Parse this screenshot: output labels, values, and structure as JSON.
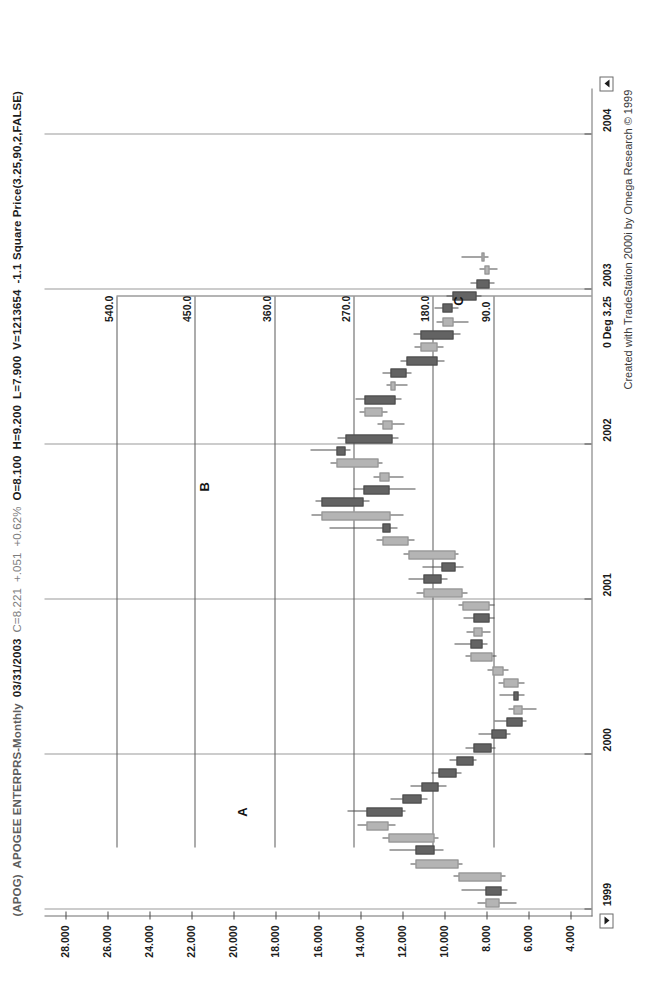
{
  "window": {
    "app": "TradeStation 2000i",
    "footer": "Created with TradeStation 2000i by Omega Research © 1999"
  },
  "header": {
    "symbol": "(APOG)",
    "name": "APOGEE ENTERPRS-Monthly",
    "date": "03/31/2003",
    "close": "C=8.221",
    "change": "+.051",
    "change_pct": "+0.62%",
    "open": "O=8.100",
    "high": "H=9.200",
    "low": "L=7.900",
    "volume": "V=1213654",
    "study": "-1.1 Square Price(3.25,90,2,FALSE)"
  },
  "controls": {
    "scroll_left": "scroll-left-arrow",
    "scroll_right": "scroll-right-arrow"
  },
  "chart_data": {
    "type": "candlestick",
    "xlabel": "",
    "ylabel": "",
    "grid": true,
    "legend": "none",
    "ylim": [
      3.0,
      29.0
    ],
    "yticks": [
      "28.000",
      "26.000",
      "24.000",
      "22.000",
      "20.000",
      "18.000",
      "16.000",
      "14.000",
      "12.000",
      "10.000",
      "8.000",
      "6.000",
      "4.000"
    ],
    "ytick_values": [
      28,
      26,
      24,
      22,
      20,
      18,
      16,
      14,
      12,
      10,
      8,
      6,
      4
    ],
    "xticks": [
      "1999",
      "2000",
      "2001",
      "2002",
      "2003",
      "2004"
    ],
    "xtick_values": [
      1999,
      2000,
      2001,
      2002,
      2003,
      2004
    ],
    "overlay": {
      "name": "Square Price(3.25,90,2,FALSE)",
      "origin_label": "0 Deg 3.25",
      "origin_x": 2002.96,
      "lines": [
        {
          "label": "540.0",
          "value": 25.6,
          "x_start": 1999.4
        },
        {
          "label": "450.0",
          "value": 21.85,
          "x_start": 1999.4
        },
        {
          "label": "360.0",
          "value": 18.05,
          "x_start": 1999.4
        },
        {
          "label": "270.0",
          "value": 14.3,
          "x_start": 1999.4
        },
        {
          "label": "180.0",
          "value": 10.55,
          "x_start": 1999.4
        },
        {
          "label": "90.0",
          "value": 7.65,
          "x_start": 1999.4
        }
      ]
    },
    "annotations": [
      {
        "text": "A",
        "x": 1999.63,
        "y": 19.6
      },
      {
        "text": "B",
        "x": 2001.73,
        "y": 21.4
      },
      {
        "text": "C",
        "x": 2002.93,
        "y": 9.3
      }
    ],
    "bars": [
      {
        "t": "1999-01",
        "x": 1999.04,
        "o": 7.35,
        "h": 8.4,
        "l": 6.55,
        "c": 8.05,
        "dir": "up"
      },
      {
        "t": "1999-02",
        "x": 1999.12,
        "o": 8.05,
        "h": 9.2,
        "l": 7.0,
        "c": 7.3,
        "dir": "down"
      },
      {
        "t": "1999-03",
        "x": 1999.21,
        "o": 7.3,
        "h": 9.55,
        "l": 7.1,
        "c": 9.3,
        "dir": "up"
      },
      {
        "t": "1999-04",
        "x": 1999.29,
        "o": 9.3,
        "h": 11.6,
        "l": 9.15,
        "c": 11.35,
        "dir": "up"
      },
      {
        "t": "1999-05",
        "x": 1999.38,
        "o": 11.35,
        "h": 12.6,
        "l": 10.05,
        "c": 10.45,
        "dir": "down"
      },
      {
        "t": "1999-06",
        "x": 1999.46,
        "o": 10.45,
        "h": 12.95,
        "l": 10.25,
        "c": 12.65,
        "dir": "up"
      },
      {
        "t": "1999-07",
        "x": 1999.54,
        "o": 12.65,
        "h": 14.1,
        "l": 12.3,
        "c": 13.7,
        "dir": "up"
      },
      {
        "t": "1999-08",
        "x": 1999.63,
        "o": 13.7,
        "h": 14.6,
        "l": 11.85,
        "c": 12.0,
        "dir": "down"
      },
      {
        "t": "1999-09",
        "x": 1999.71,
        "o": 12.0,
        "h": 12.55,
        "l": 10.8,
        "c": 11.1,
        "dir": "down"
      },
      {
        "t": "1999-10",
        "x": 1999.79,
        "o": 11.1,
        "h": 11.6,
        "l": 9.9,
        "c": 10.25,
        "dir": "down"
      },
      {
        "t": "1999-11",
        "x": 1999.88,
        "o": 10.25,
        "h": 10.6,
        "l": 9.2,
        "c": 9.4,
        "dir": "down"
      },
      {
        "t": "1999-12",
        "x": 1999.96,
        "o": 9.4,
        "h": 9.75,
        "l": 8.45,
        "c": 8.6,
        "dir": "down"
      },
      {
        "t": "2000-01",
        "x": 2000.04,
        "o": 8.6,
        "h": 9.0,
        "l": 7.55,
        "c": 7.75,
        "dir": "down"
      },
      {
        "t": "2000-02",
        "x": 2000.13,
        "o": 7.75,
        "h": 8.35,
        "l": 6.85,
        "c": 7.05,
        "dir": "down"
      },
      {
        "t": "2000-03",
        "x": 2000.21,
        "o": 7.05,
        "h": 7.6,
        "l": 6.1,
        "c": 6.3,
        "dir": "down"
      },
      {
        "t": "2000-04",
        "x": 2000.29,
        "o": 6.3,
        "h": 6.95,
        "l": 5.6,
        "c": 6.7,
        "dir": "up"
      },
      {
        "t": "2000-05",
        "x": 2000.38,
        "o": 6.7,
        "h": 7.35,
        "l": 6.2,
        "c": 6.45,
        "dir": "down"
      },
      {
        "t": "2000-06",
        "x": 2000.46,
        "o": 6.45,
        "h": 7.4,
        "l": 6.2,
        "c": 7.2,
        "dir": "up"
      },
      {
        "t": "2000-07",
        "x": 2000.54,
        "o": 7.2,
        "h": 7.95,
        "l": 6.95,
        "c": 7.7,
        "dir": "up"
      },
      {
        "t": "2000-08",
        "x": 2000.63,
        "o": 7.7,
        "h": 9.0,
        "l": 7.5,
        "c": 8.75,
        "dir": "up"
      },
      {
        "t": "2000-09",
        "x": 2000.71,
        "o": 8.75,
        "h": 9.5,
        "l": 7.95,
        "c": 8.2,
        "dir": "down"
      },
      {
        "t": "2000-10",
        "x": 2000.79,
        "o": 8.2,
        "h": 8.95,
        "l": 7.8,
        "c": 8.6,
        "dir": "up"
      },
      {
        "t": "2000-11",
        "x": 2000.88,
        "o": 8.6,
        "h": 9.1,
        "l": 7.6,
        "c": 7.85,
        "dir": "down"
      },
      {
        "t": "2000-12",
        "x": 2000.96,
        "o": 7.85,
        "h": 9.3,
        "l": 7.6,
        "c": 9.15,
        "dir": "up"
      },
      {
        "t": "2001-01",
        "x": 2001.04,
        "o": 9.15,
        "h": 11.3,
        "l": 8.9,
        "c": 11.0,
        "dir": "up"
      },
      {
        "t": "2001-02",
        "x": 2001.13,
        "o": 11.0,
        "h": 11.7,
        "l": 9.85,
        "c": 10.15,
        "dir": "down"
      },
      {
        "t": "2001-03",
        "x": 2001.21,
        "o": 10.15,
        "h": 11.05,
        "l": 9.1,
        "c": 9.45,
        "dir": "down"
      },
      {
        "t": "2001-04",
        "x": 2001.29,
        "o": 9.45,
        "h": 11.95,
        "l": 9.3,
        "c": 11.7,
        "dir": "up"
      },
      {
        "t": "2001-05",
        "x": 2001.38,
        "o": 11.7,
        "h": 13.2,
        "l": 11.4,
        "c": 12.95,
        "dir": "up"
      },
      {
        "t": "2001-06",
        "x": 2001.46,
        "o": 12.95,
        "h": 15.45,
        "l": 12.2,
        "c": 12.55,
        "dir": "down"
      },
      {
        "t": "2001-07",
        "x": 2001.54,
        "o": 12.55,
        "h": 16.3,
        "l": 11.95,
        "c": 15.85,
        "dir": "up"
      },
      {
        "t": "2001-08",
        "x": 2001.63,
        "o": 15.85,
        "h": 16.1,
        "l": 13.55,
        "c": 13.85,
        "dir": "down"
      },
      {
        "t": "2001-09",
        "x": 2001.71,
        "o": 13.85,
        "h": 14.3,
        "l": 11.35,
        "c": 12.6,
        "dir": "down"
      },
      {
        "t": "2001-10",
        "x": 2001.79,
        "o": 12.6,
        "h": 13.35,
        "l": 11.95,
        "c": 13.1,
        "dir": "up"
      },
      {
        "t": "2001-11",
        "x": 2001.88,
        "o": 13.1,
        "h": 15.4,
        "l": 12.95,
        "c": 15.1,
        "dir": "up"
      },
      {
        "t": "2001-12",
        "x": 2001.96,
        "o": 15.1,
        "h": 16.35,
        "l": 14.45,
        "c": 14.7,
        "dir": "down"
      },
      {
        "t": "2002-01",
        "x": 2002.04,
        "o": 14.7,
        "h": 15.05,
        "l": 12.15,
        "c": 12.45,
        "dir": "down"
      },
      {
        "t": "2002-02",
        "x": 2002.13,
        "o": 12.45,
        "h": 13.15,
        "l": 11.9,
        "c": 12.95,
        "dir": "up"
      },
      {
        "t": "2002-03",
        "x": 2002.21,
        "o": 12.95,
        "h": 14.05,
        "l": 12.7,
        "c": 13.8,
        "dir": "up"
      },
      {
        "t": "2002-04",
        "x": 2002.29,
        "o": 13.8,
        "h": 14.2,
        "l": 12.05,
        "c": 12.3,
        "dir": "down"
      },
      {
        "t": "2002-05",
        "x": 2002.38,
        "o": 12.3,
        "h": 12.75,
        "l": 11.75,
        "c": 12.55,
        "dir": "up"
      },
      {
        "t": "2002-06",
        "x": 2002.46,
        "o": 12.55,
        "h": 12.95,
        "l": 11.55,
        "c": 11.8,
        "dir": "down"
      },
      {
        "t": "2002-07",
        "x": 2002.54,
        "o": 11.8,
        "h": 12.1,
        "l": 10.0,
        "c": 10.3,
        "dir": "down"
      },
      {
        "t": "2002-08",
        "x": 2002.63,
        "o": 10.3,
        "h": 11.4,
        "l": 10.05,
        "c": 11.15,
        "dir": "up"
      },
      {
        "t": "2002-09",
        "x": 2002.71,
        "o": 11.15,
        "h": 11.45,
        "l": 9.25,
        "c": 9.55,
        "dir": "down"
      },
      {
        "t": "2002-10",
        "x": 2002.79,
        "o": 9.55,
        "h": 10.35,
        "l": 8.85,
        "c": 10.1,
        "dir": "up"
      },
      {
        "t": "2002-11",
        "x": 2002.88,
        "o": 10.1,
        "h": 10.45,
        "l": 9.3,
        "c": 9.6,
        "dir": "down"
      },
      {
        "t": "2002-96",
        "x": 2002.96,
        "o": 9.6,
        "h": 9.9,
        "l": 8.25,
        "c": 8.45,
        "dir": "down"
      },
      {
        "t": "2003-01",
        "x": 2003.04,
        "o": 8.45,
        "h": 8.75,
        "l": 7.6,
        "c": 7.85,
        "dir": "down"
      },
      {
        "t": "2003-02",
        "x": 2003.13,
        "o": 7.85,
        "h": 8.3,
        "l": 7.45,
        "c": 8.1,
        "dir": "up"
      },
      {
        "t": "2003-03",
        "x": 2003.21,
        "o": 8.1,
        "h": 9.2,
        "l": 7.9,
        "c": 8.221,
        "dir": "up"
      }
    ]
  }
}
